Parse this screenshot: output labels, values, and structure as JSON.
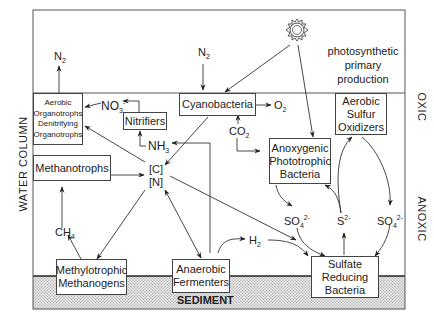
{
  "diagram": {
    "zones": {
      "oxic": "OXIC",
      "anoxic": "ANOXIC",
      "water_column": "WATER COLUMN",
      "sediment": "SEDIMENT"
    },
    "primary_production": {
      "icon": "sun-icon",
      "label_lines": [
        "photosynthetic",
        "primary",
        "production"
      ]
    },
    "nodes": {
      "aerobic_organotrophs": [
        "Aerobic",
        "Organotrophs",
        "Denitrifying",
        "Organotrophs"
      ],
      "nitrifiers": "Nitrifiers",
      "cyanobacteria": "Cyanobacteria",
      "aerobic_sulfur_oxidizers": [
        "Aerobic",
        "Sulfur",
        "Oxidizers"
      ],
      "methanotrophs": "Methanotrophs",
      "anoxygenic_phototrophic": [
        "Anoxygenic",
        "Phototrophic",
        "Bacteria"
      ],
      "methylotrophic_methanogens": [
        "Methylotrophic",
        "Methanogens"
      ],
      "anaerobic_fermenters": [
        "Anaerobic",
        "Fermenters"
      ],
      "sulfate_reducing": [
        "Sulfate",
        "Reducing",
        "Bacteria"
      ],
      "carbon_nitrogen_pool": [
        "[C]",
        "[N]"
      ]
    },
    "species": {
      "n2_left": {
        "base": "N",
        "sub": "2"
      },
      "n2_top": {
        "base": "N",
        "sub": "2"
      },
      "no3": {
        "base": "NO",
        "sub": "3",
        "sup": "-"
      },
      "nh3": {
        "base": "NH",
        "sub": "3"
      },
      "o2": {
        "base": "O",
        "sub": "2"
      },
      "co2": {
        "base": "CO",
        "sub": "2"
      },
      "ch4": {
        "base": "CH",
        "sub": "4"
      },
      "h2": {
        "base": "H",
        "sub": "2"
      },
      "so4_left": {
        "base": "SO",
        "sub": "4",
        "sup": "2-"
      },
      "s2": {
        "base": "S",
        "sup": "2-"
      },
      "so4_right": {
        "base": "SO",
        "sub": "4",
        "sup": "2-"
      }
    }
  }
}
